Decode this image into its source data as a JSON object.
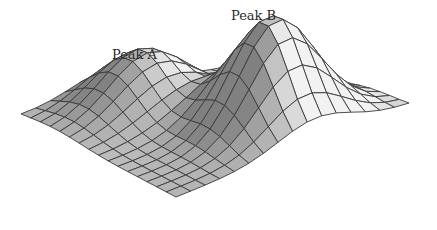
{
  "chart_data": {
    "type": "surface",
    "title": "",
    "xlabel": "",
    "ylabel": "",
    "zlabel": "",
    "axes_visible": false,
    "grid": {
      "rows": 16,
      "cols": 16
    },
    "surface_function": "z = sum of two Gaussian bumps over a flat base plane",
    "series": [
      {
        "name": "Peak A",
        "center": [
          0.62,
          0.22
        ],
        "height": 0.55,
        "sigma": 0.17
      },
      {
        "name": "Peak B",
        "center": [
          0.4,
          0.72
        ],
        "height": 1.0,
        "sigma": 0.16
      }
    ],
    "annotations": [
      {
        "text": "Peak A",
        "target": "Peak A"
      },
      {
        "text": "Peak B",
        "target": "Peak B"
      }
    ],
    "colors": {
      "surface_light": "#ececec",
      "surface_dark": "#9a9a9a",
      "mesh_line": "#3a3a3a",
      "background": "#ffffff"
    }
  },
  "labels": {
    "peak_a": "Peak A",
    "peak_b": "Peak B"
  }
}
